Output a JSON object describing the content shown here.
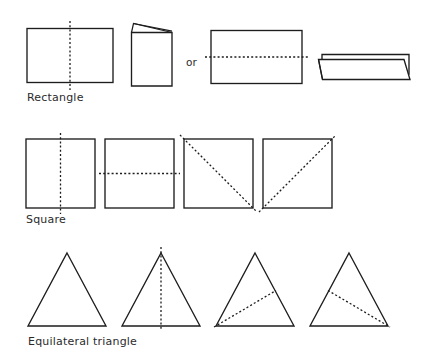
{
  "figure": {
    "background_color": "#ffffff",
    "stroke_color": "#1d1d1d",
    "rows": [
      {
        "id": "rectangle",
        "label": "Rectangle",
        "connector_label": "or",
        "items": [
          {
            "name": "rectangle-plain-with-vertical-fold",
            "kind": "rectangle",
            "fold": "vertical"
          },
          {
            "name": "rectangle-folded-vertically",
            "kind": "folded-card",
            "fold": "vertical-result"
          },
          {
            "name": "rectangle-plain-with-horizontal-fold",
            "kind": "rectangle",
            "fold": "horizontal"
          },
          {
            "name": "rectangle-folded-horizontally",
            "kind": "folded-card",
            "fold": "horizontal-result"
          }
        ]
      },
      {
        "id": "square",
        "label": "Square",
        "items": [
          {
            "name": "square-vertical-fold",
            "kind": "square",
            "fold": "vertical"
          },
          {
            "name": "square-horizontal-fold",
            "kind": "square",
            "fold": "horizontal"
          },
          {
            "name": "square-diagonal-fold-tl-br",
            "kind": "square",
            "fold": "diagonal-tl-br"
          },
          {
            "name": "square-diagonal-fold-bl-tr",
            "kind": "square",
            "fold": "diagonal-bl-tr"
          }
        ]
      },
      {
        "id": "equilateral-triangle",
        "label": "Equilateral triangle",
        "items": [
          {
            "name": "triangle-plain",
            "kind": "triangle",
            "fold": "none"
          },
          {
            "name": "triangle-vertical-fold",
            "kind": "triangle",
            "fold": "apex-to-base-midpoint"
          },
          {
            "name": "triangle-fold-bottom-left-to-right-midpoint",
            "kind": "triangle",
            "fold": "bottom-left-to-right-side-midpoint"
          },
          {
            "name": "triangle-fold-left-midpoint-to-bottom-right",
            "kind": "triangle",
            "fold": "left-side-midpoint-to-bottom-right"
          }
        ]
      }
    ]
  }
}
